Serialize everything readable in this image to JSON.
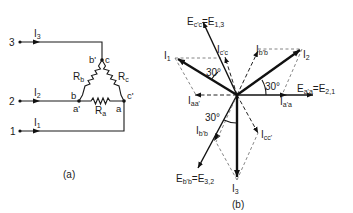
{
  "figure_a": {
    "caption": "(a)",
    "terminals": [
      {
        "id": "3",
        "label": "3",
        "current_label": "I",
        "current_sub": "3"
      },
      {
        "id": "2",
        "label": "2",
        "current_label": "I",
        "current_sub": "2"
      },
      {
        "id": "1",
        "label": "1",
        "current_label": "I",
        "current_sub": "1"
      }
    ],
    "nodes": {
      "top_left": "b'",
      "top_right": "c",
      "left_top": "b",
      "left_bottom": "a'",
      "right_top": "c'",
      "right_bottom": "a"
    },
    "resistors": [
      {
        "id": "Rb",
        "label": "R",
        "sub": "b"
      },
      {
        "id": "Rc",
        "label": "R",
        "sub": "c"
      },
      {
        "id": "Ra",
        "label": "R",
        "sub": "a"
      }
    ]
  },
  "figure_b": {
    "caption": "(b)",
    "phasors": {
      "E_cc": {
        "label": "E",
        "sub": "c'c",
        "eq": "=E",
        "eq_sub": "1,3"
      },
      "E_aa": {
        "label": "E",
        "sub": "a'a",
        "eq": "=E",
        "eq_sub": "2,1"
      },
      "E_bb": {
        "label": "E",
        "sub": "b'b",
        "eq": "=E",
        "eq_sub": "3,2"
      },
      "I1": {
        "label": "I",
        "sub": "1"
      },
      "I2": {
        "label": "I",
        "sub": "2"
      },
      "I3": {
        "label": "I",
        "sub": "3"
      },
      "I_cc_prime": {
        "label": "I",
        "sub": "c'c"
      },
      "I_bb_prime": {
        "label": "I",
        "sub": "b'b"
      },
      "I_aa_prime": {
        "label": "I",
        "sub": "a'a"
      },
      "I_aa_neg": {
        "label": "I",
        "sub": "aa'"
      },
      "I_cc_neg": {
        "label": "I",
        "sub": "cc'"
      },
      "I_bb_lower": {
        "label": "I",
        "sub": "b'b"
      }
    },
    "angles": [
      {
        "id": "angle-I1-Ecc",
        "text": "30°"
      },
      {
        "id": "angle-I2-Eaa",
        "text": "30°"
      },
      {
        "id": "angle-I3-Ebb",
        "text": "30°"
      }
    ]
  }
}
